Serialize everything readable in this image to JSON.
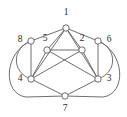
{
  "figure": {
    "type": "undirected-graph-drawing",
    "background_color": "#ffffff",
    "edge_color": "#5d5f63",
    "node_fill_color": "#ffffff",
    "node_stroke_color": "#5a5c60",
    "label_color": "#2b2b2b"
  },
  "vertices": [
    {
      "id": "1",
      "label": "1",
      "cx": 66,
      "cy": 28,
      "r": 3.2,
      "label_x": 66,
      "label_y": 13
    },
    {
      "id": "8",
      "label": "8",
      "cx": 31,
      "cy": 41,
      "r": 3.2,
      "label_x": 20,
      "label_y": 40
    },
    {
      "id": "5",
      "label": "5",
      "cx": 47,
      "cy": 50,
      "r": 3.2,
      "label_x": 45,
      "label_y": 39
    },
    {
      "id": "2",
      "label": "2",
      "cx": 82,
      "cy": 50,
      "r": 3.2,
      "label_x": 82,
      "label_y": 39
    },
    {
      "id": "6",
      "label": "6",
      "cx": 98,
      "cy": 41,
      "r": 3.2,
      "label_x": 109,
      "label_y": 40
    },
    {
      "id": "4",
      "label": "4",
      "cx": 31,
      "cy": 79,
      "r": 3.2,
      "label_x": 20,
      "label_y": 79
    },
    {
      "id": "3",
      "label": "3",
      "cx": 98,
      "cy": 79,
      "r": 3.2,
      "label_x": 109,
      "label_y": 79
    },
    {
      "id": "7",
      "label": "7",
      "cx": 65,
      "cy": 96,
      "r": 3.2,
      "label_x": 65,
      "label_y": 109
    }
  ],
  "edges": [
    {
      "id": "e-1-8",
      "from": "1",
      "to": "8",
      "shape": "line",
      "d": "M 66 28 L 31 41"
    },
    {
      "id": "e-1-5",
      "from": "1",
      "to": "5",
      "shape": "line",
      "d": "M 66 28 L 47 50"
    },
    {
      "id": "e-1-2",
      "from": "1",
      "to": "2",
      "shape": "line",
      "d": "M 66 28 L 82 50"
    },
    {
      "id": "e-1-6",
      "from": "1",
      "to": "6",
      "shape": "line",
      "d": "M 66 28 L 98 41"
    },
    {
      "id": "e-1-4",
      "from": "1",
      "to": "4",
      "shape": "line",
      "d": "M 66 28 L 31 79"
    },
    {
      "id": "e-1-3",
      "from": "1",
      "to": "3",
      "shape": "line",
      "d": "M 66 28 L 98 79"
    },
    {
      "id": "e-5-2",
      "from": "5",
      "to": "2",
      "shape": "line",
      "d": "M 47 50 L 82 50"
    },
    {
      "id": "e-5-4",
      "from": "5",
      "to": "4",
      "shape": "line",
      "d": "M 47 50 L 31 79"
    },
    {
      "id": "e-5-3",
      "from": "5",
      "to": "3",
      "shape": "line",
      "d": "M 47 50 L 98 79"
    },
    {
      "id": "e-2-4",
      "from": "2",
      "to": "4",
      "shape": "line",
      "d": "M 82 50 L 31 79"
    },
    {
      "id": "e-2-3",
      "from": "2",
      "to": "3",
      "shape": "line",
      "d": "M 82 50 L 98 79"
    },
    {
      "id": "e-8-4",
      "from": "8",
      "to": "4",
      "shape": "line",
      "d": "M 31 41 L 31 79"
    },
    {
      "id": "e-6-3",
      "from": "6",
      "to": "3",
      "shape": "line",
      "d": "M 98 41 L 98 79"
    },
    {
      "id": "e-4-7",
      "from": "4",
      "to": "7",
      "shape": "line",
      "d": "M 31 79 L 65 96"
    },
    {
      "id": "e-3-7",
      "from": "3",
      "to": "7",
      "shape": "line",
      "d": "M 98 79 L 65 96"
    },
    {
      "id": "e-8-4-curve",
      "from": "8",
      "to": "4",
      "shape": "curve",
      "d": "M 31 41 C 12 48 11 72 31 79"
    },
    {
      "id": "e-6-3-curve",
      "from": "6",
      "to": "3",
      "shape": "curve",
      "d": "M 98 41 C 117 48 118 72 98 79"
    },
    {
      "id": "e-8-7-curve",
      "from": "8",
      "to": "7",
      "shape": "curve",
      "d": "M 31 41 C 4 52 2 94 26 97 L 65 96"
    },
    {
      "id": "e-6-7-curve",
      "from": "6",
      "to": "7",
      "shape": "curve",
      "d": "M 98 41 C 125 52 127 94 103 97 L 65 96"
    }
  ],
  "adjacency_summary": {
    "1": [
      "8",
      "5",
      "2",
      "6",
      "4",
      "3"
    ],
    "2": [
      "1",
      "5",
      "4",
      "3"
    ],
    "3": [
      "1",
      "5",
      "2",
      "6",
      "7"
    ],
    "4": [
      "1",
      "5",
      "2",
      "8",
      "7"
    ],
    "5": [
      "1",
      "2",
      "4",
      "3"
    ],
    "6": [
      "1",
      "3",
      "7"
    ],
    "7": [
      "4",
      "3",
      "8",
      "6"
    ],
    "8": [
      "1",
      "4",
      "7"
    ]
  }
}
